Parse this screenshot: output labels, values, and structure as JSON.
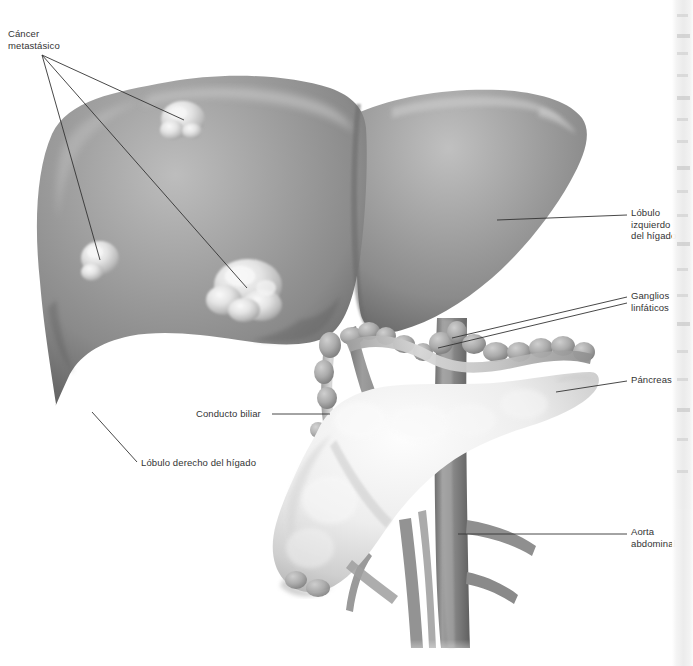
{
  "figure": {
    "width": 693,
    "height": 666,
    "background_color": "#ffffff",
    "text_color": "#333333",
    "leader_line_color": "#333333"
  },
  "palette": {
    "liver_mid": "#9a9a9a",
    "liver_dark": "#6f6f6f",
    "liver_light": "#b9b9b9",
    "tumor_light": "#ededed",
    "pancreas_light": "#f0f0f0",
    "vessel_gray": "#8d8d8d",
    "duct_light": "#c9c9c9",
    "node_gray": "#a8a8a8"
  },
  "labels": [
    {
      "id": "cancer-metastasico",
      "text": "Cáncer\nmetastásico",
      "lines": [
        "Cáncer",
        "metastásico"
      ],
      "x": 8,
      "y": 28,
      "align": "left",
      "leader_count": 3
    },
    {
      "id": "lobulo-izquierdo",
      "text": "Lóbulo\nizquierdo\ndel hígado",
      "lines": [
        "Lóbulo",
        "izquierdo",
        "del hígado"
      ],
      "x": 631,
      "y": 207,
      "align": "left",
      "leader_count": 1
    },
    {
      "id": "ganglios-linfaticos",
      "text": "Ganglios\nlinfáticos",
      "lines": [
        "Ganglios",
        "linfáticos"
      ],
      "x": 631,
      "y": 290,
      "align": "left",
      "leader_count": 2
    },
    {
      "id": "pancreas",
      "text": "Páncreas",
      "lines": [
        "Páncreas"
      ],
      "x": 631,
      "y": 374,
      "align": "left",
      "leader_count": 1
    },
    {
      "id": "aorta-abdominal",
      "text": "Aorta\nabdominal",
      "lines": [
        "Aorta",
        "abdominal"
      ],
      "x": 631,
      "y": 526,
      "align": "left",
      "leader_count": 1
    },
    {
      "id": "conducto-biliar",
      "text": "Conducto biliar",
      "lines": [
        "Conducto biliar"
      ],
      "x": 196,
      "y": 410,
      "align": "left",
      "leader_count": 1
    },
    {
      "id": "lobulo-derecho",
      "text": "Lóbulo derecho del hígado",
      "lines": [
        "Lóbulo derecho del hígado"
      ],
      "x": 141,
      "y": 459,
      "align": "left",
      "leader_count": 1
    }
  ],
  "structures": [
    {
      "id": "liver-right-lobe",
      "name": "Lóbulo derecho del hígado"
    },
    {
      "id": "liver-left-lobe",
      "name": "Lóbulo izquierdo del hígado"
    },
    {
      "id": "metastatic-tumor-1",
      "name": "Tumor metastásico superior"
    },
    {
      "id": "metastatic-tumor-2",
      "name": "Tumor metastásico lateral"
    },
    {
      "id": "metastatic-tumor-3",
      "name": "Tumor metastásico inferior"
    },
    {
      "id": "pancreas",
      "name": "Páncreas"
    },
    {
      "id": "aorta",
      "name": "Aorta abdominal"
    },
    {
      "id": "bile-duct",
      "name": "Conducto biliar"
    },
    {
      "id": "lymph-nodes",
      "name": "Ganglios linfáticos"
    }
  ]
}
